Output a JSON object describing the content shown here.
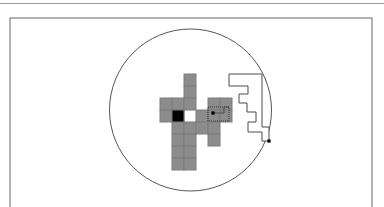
{
  "figure": {
    "canvas": {
      "width": 384,
      "height": 207
    },
    "top_rule": {
      "y": 3,
      "color": "#9a9a9a",
      "thickness": 1
    },
    "frame": {
      "x": 10,
      "y": 18,
      "width": 362,
      "height": 196,
      "stroke": "#6b6b6b",
      "stroke_width": 1,
      "fill": "#ffffff"
    },
    "circle": {
      "cx": 190.5,
      "cy": 110,
      "r": 81,
      "stroke": "#555555",
      "stroke_width": 1,
      "fill": "none"
    },
    "grid": {
      "cell_size": 12,
      "origin_x": 148,
      "origin_y": 74,
      "stroke": "#7d7d7d",
      "stroke_width": 1,
      "gray_fill": "#8c8c8c",
      "black_fill": "#000000",
      "gray_cells": [
        [
          3,
          0
        ],
        [
          3,
          1
        ],
        [
          1,
          2
        ],
        [
          2,
          2
        ],
        [
          3,
          2
        ],
        [
          5,
          2
        ],
        [
          6,
          2
        ],
        [
          1,
          3
        ],
        [
          2,
          3
        ],
        [
          4,
          3
        ],
        [
          5,
          3
        ],
        [
          6,
          3
        ],
        [
          2,
          4
        ],
        [
          3,
          4
        ],
        [
          4,
          4
        ],
        [
          5,
          4
        ],
        [
          2,
          5
        ],
        [
          3,
          5
        ],
        [
          5,
          5
        ],
        [
          2,
          6
        ],
        [
          3,
          6
        ],
        [
          2,
          7
        ],
        [
          3,
          7
        ]
      ],
      "black_cells": [
        [
          2,
          3
        ]
      ]
    },
    "polygon": {
      "stroke": "#4a4a4a",
      "stroke_width": 1,
      "fill": "#ffffff",
      "points": "229,74 260,74 260,99 247,99 247,94 238,94 238,104 246,104 246,112 254,112 254,121 246,121 246,131 262,131 262,141 269,141 269,128 269,74",
      "path": "M 229,74 L 262,74 L 262,127 L 269,127 L 269,141 L 262,141 L 262,132 L 248,132 L 248,122 L 256,122 L 256,112 L 247,112 L 247,103 L 239,103 L 239,94 L 248,94 L 248,86 L 229,86 Z"
    },
    "dotted_box": {
      "x": 208,
      "y": 107,
      "width": 21,
      "height": 14,
      "stroke": "#333333",
      "stroke_width": 1,
      "dash": "1,1",
      "fill": "none"
    },
    "connector": {
      "stroke": "#4a4a4a",
      "stroke_width": 1,
      "path": "M 213,113 L 224,113 L 224,107 L 229,107"
    },
    "markers": [
      {
        "name": "dotted-box-center-point",
        "cx": 213,
        "cy": 113,
        "size": 3.2,
        "fill": "#000000"
      },
      {
        "name": "circle-edge-point",
        "cx": 269,
        "cy": 141,
        "size": 3.2,
        "fill": "#000000"
      }
    ]
  }
}
